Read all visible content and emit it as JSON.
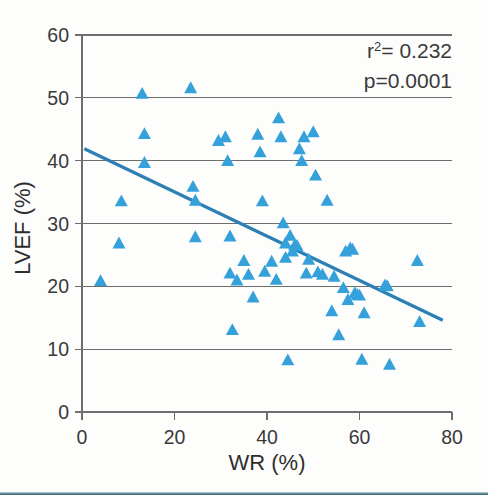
{
  "figure": {
    "background_color": "#fdfdfc",
    "footer_rule_color": "#2f5e6e"
  },
  "chart_data": {
    "type": "scatter",
    "title": "",
    "xlabel": "WR  (%)",
    "ylabel": "LVEF  (%)",
    "xlim": [
      0,
      80
    ],
    "ylim": [
      0,
      60
    ],
    "xticks": [
      0,
      20,
      40,
      60,
      80
    ],
    "yticks": [
      0,
      10,
      20,
      30,
      40,
      50,
      60
    ],
    "xtick_labels": [
      "0",
      "20",
      "40",
      "60",
      "80"
    ],
    "ytick_labels": [
      "0",
      "10",
      "20",
      "30",
      "40",
      "50",
      "60"
    ],
    "grid": "horizontal",
    "grid_color": "#6e6e6e",
    "marker": {
      "shape": "triangle-up",
      "color": "#35a1db",
      "size": 13
    },
    "legend": "none",
    "annotations": {
      "r_squared_label": "r",
      "r_squared_exponent": "2",
      "r_squared_value": "= 0.232",
      "p_value_text": "p=0.0001"
    },
    "fit_line": {
      "color": "#2b7fb5",
      "x_start": 0.5,
      "y_start": 41.9,
      "x_end": 78.0,
      "y_end": 14.6,
      "slope": -0.352,
      "intercept": 42.08
    },
    "x": [
      4.0,
      8.0,
      8.5,
      13.0,
      13.5,
      13.5,
      23.5,
      24.0,
      24.5,
      24.5,
      29.5,
      31.0,
      31.5,
      32.0,
      32.0,
      32.5,
      33.5,
      35.0,
      36.0,
      37.0,
      38.0,
      38.5,
      39.0,
      39.5,
      41.0,
      42.0,
      42.5,
      43.0,
      43.5,
      44.0,
      44.0,
      44.5,
      45.0,
      45.5,
      46.0,
      46.5,
      47.0,
      47.5,
      48.0,
      48.5,
      49.0,
      50.0,
      50.5,
      51.0,
      52.0,
      53.0,
      54.0,
      54.5,
      55.5,
      56.5,
      57.0,
      57.5,
      58.0,
      58.5,
      59.0,
      59.5,
      60.0,
      60.5,
      61.0,
      65.5,
      66.0,
      66.5,
      72.5,
      73.0
    ],
    "y": [
      20.8,
      26.8,
      33.5,
      50.6,
      44.2,
      39.6,
      51.5,
      35.8,
      33.6,
      27.8,
      43.1,
      43.7,
      39.9,
      27.9,
      22.0,
      13.0,
      20.9,
      24.0,
      21.8,
      18.2,
      44.1,
      41.3,
      33.5,
      22.3,
      23.9,
      21.0,
      46.7,
      43.7,
      30.0,
      26.8,
      24.5,
      8.2,
      28.0,
      25.5,
      26.5,
      26.4,
      41.8,
      39.9,
      43.7,
      22.0,
      24.2,
      44.5,
      37.6,
      22.2,
      21.8,
      33.6,
      16.0,
      21.5,
      12.2,
      19.7,
      25.5,
      17.8,
      26.0,
      25.8,
      18.9,
      18.6,
      18.5,
      8.3,
      15.7,
      20.1,
      20.0,
      7.5,
      24.0,
      14.3
    ]
  }
}
